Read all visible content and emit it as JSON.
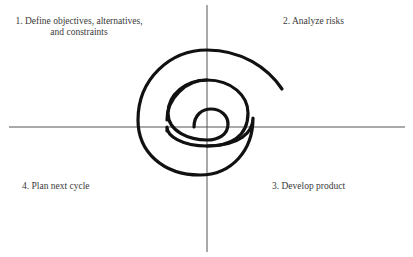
{
  "diagram": {
    "type": "spiral-quadrants",
    "colors": {
      "axis": "#555555",
      "spiral": "#111111",
      "text": "#3a3a3a",
      "background": "#ffffff"
    },
    "quadrants": [
      {
        "position": "top-left",
        "label": "1. Define objectives, alternatives, and constraints"
      },
      {
        "position": "top-right",
        "label": "2. Analyze risks"
      },
      {
        "position": "bottom-right",
        "label": "3. Develop product"
      },
      {
        "position": "bottom-left",
        "label": "4. Plan next cycle"
      }
    ]
  }
}
